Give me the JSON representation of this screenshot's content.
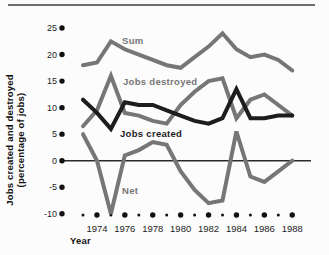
{
  "chart_data": {
    "type": "line",
    "title": "",
    "xlabel": "Year",
    "ylabel": "Jobs created and destroyed (percentage of jobs)",
    "ylabel_lines": [
      "Jobs created and destroyed",
      "(percentage of jobs)"
    ],
    "x": [
      1973,
      1974,
      1975,
      1976,
      1977,
      1978,
      1979,
      1980,
      1981,
      1982,
      1983,
      1984,
      1985,
      1986,
      1987,
      1988
    ],
    "x_labeled_years": [
      1974,
      1976,
      1978,
      1980,
      1982,
      1984,
      1986,
      1988
    ],
    "y_ticks": [
      25,
      20,
      15,
      10,
      5,
      0,
      -5,
      -10
    ],
    "y_tick_labels": [
      "25",
      "20",
      "15",
      "10",
      "5",
      "0",
      "-5",
      "-10"
    ],
    "ylim": [
      -10,
      25
    ],
    "xlim": [
      1973,
      1988
    ],
    "grid": false,
    "legend": "inline-labels",
    "series": [
      {
        "name": "Sum",
        "color": "#767676",
        "values": [
          18,
          18.5,
          22.5,
          21,
          20,
          19,
          18,
          17.5,
          19.5,
          21.5,
          24,
          21,
          19.5,
          20,
          19,
          17
        ]
      },
      {
        "name": "Jobs destroyed",
        "color": "#767676",
        "values": [
          6.5,
          9.5,
          16,
          9,
          8.5,
          7.5,
          7,
          10.5,
          13,
          15,
          15.5,
          8,
          11.5,
          12.5,
          10.5,
          8.5
        ]
      },
      {
        "name": "Jobs created",
        "color": "#1d1d1d",
        "values": [
          11.5,
          9,
          6,
          11,
          10.5,
          10.5,
          9.5,
          8.5,
          7.5,
          7,
          8,
          13.5,
          8,
          8,
          8.5,
          8.5
        ]
      },
      {
        "name": "Net",
        "color": "#767676",
        "values": [
          5,
          0,
          -10,
          1,
          2,
          3.5,
          3,
          -2,
          -5.5,
          -8,
          -7.5,
          5.5,
          -3,
          -4,
          -2,
          0
        ]
      }
    ],
    "label_positions": [
      [
        122,
        44
      ],
      [
        123,
        85
      ],
      [
        120,
        137
      ],
      [
        122,
        194
      ]
    ]
  }
}
